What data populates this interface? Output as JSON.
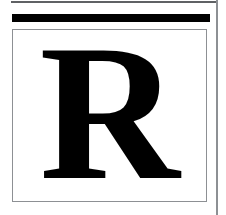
{
  "page": {
    "kind": "scanned-page-fragment",
    "width": 226,
    "height": 215,
    "background_color": "#ffffff"
  },
  "rules": {
    "top_hairline": {
      "name": "top-hairline-rule",
      "color": "#5f6164",
      "thickness_px": 2
    },
    "heavy_rule": {
      "name": "heavy-horizontal-rule",
      "color": "#000000",
      "thickness_px": 8
    },
    "column_rule": {
      "name": "right-column-rule",
      "color": "#8d9094",
      "thickness_px": 2,
      "orientation": "vertical"
    }
  },
  "letter_box": {
    "border_color": "#8d9094",
    "fill_color": "#ffffff",
    "border_width_px": 1
  },
  "drop_letter": {
    "character": "R",
    "color": "#000000",
    "style": "serif-bold",
    "role": "section-divider-initial"
  }
}
